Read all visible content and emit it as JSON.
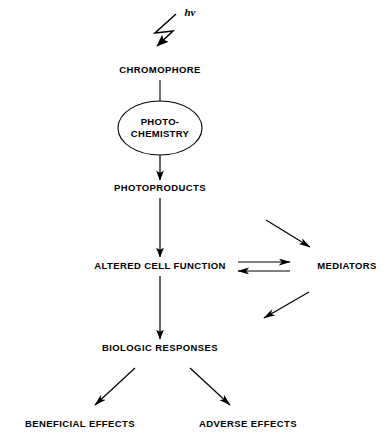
{
  "figure": {
    "background_color": "#ffffff",
    "line_color": "#000000",
    "text_color": "#000000"
  },
  "nodes": {
    "radiation": {
      "label": "hν",
      "x": 190,
      "y": 10
    },
    "chromophore": {
      "label": "CHROMOPHORE",
      "x": 160,
      "y": 70
    },
    "photochemistry": {
      "line1": "PHOTO-",
      "line2": "CHEMISTRY",
      "cx": 160,
      "cy": 128,
      "rx": 42,
      "ry": 27
    },
    "photoproducts": {
      "label": "PHOTOPRODUCTS",
      "x": 160,
      "y": 188
    },
    "altered_cell_function": {
      "label": "ALTERED CELL FUNCTION",
      "x": 160,
      "y": 266
    },
    "mediators": {
      "label": "MEDIATORS",
      "x": 347,
      "y": 266
    },
    "biologic_responses": {
      "label": "BIOLOGIC RESPONSES",
      "x": 160,
      "y": 348
    },
    "beneficial_effects": {
      "label": "BENEFICIAL EFFECTS",
      "x": 80,
      "y": 424
    },
    "adverse_effects": {
      "label": "ADVERSE EFFECTS",
      "x": 248,
      "y": 424
    }
  },
  "connectors": {
    "photon_bolt": {
      "name": "zigzag lightning arrow",
      "direction": "down-left"
    },
    "chromophore_to_photochemistry": {
      "name": "plain vertical line",
      "direction": "down"
    },
    "photochemistry_to_photoproducts": {
      "name": "vertical arrow",
      "direction": "down"
    },
    "photoproducts_to_altered": {
      "name": "vertical arrow",
      "direction": "down"
    },
    "altered_to_mediators": {
      "name": "equilibrium double arrow",
      "direction": "bidirectional"
    },
    "into_mediators": {
      "name": "diagonal arrow",
      "direction": "down-right"
    },
    "from_mediators": {
      "name": "diagonal arrow",
      "direction": "down-left"
    },
    "altered_to_biologic": {
      "name": "vertical arrow",
      "direction": "down"
    },
    "biologic_to_beneficial": {
      "name": "diagonal arrow",
      "direction": "down-left"
    },
    "biologic_to_adverse": {
      "name": "diagonal arrow",
      "direction": "down-right"
    }
  }
}
